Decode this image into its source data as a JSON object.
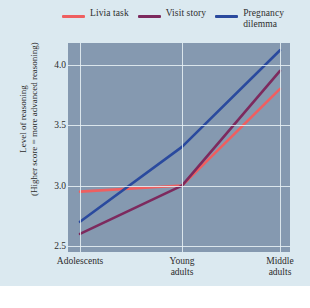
{
  "chart_data": {
    "type": "line",
    "title": "",
    "xlabel": "",
    "ylabel": "Level of reasoning\n(Higher score = more advanced reasoning)",
    "categories": [
      "Adolescents",
      "Young\nadults",
      "Middle\nadults"
    ],
    "ylim": [
      2.45,
      4.18
    ],
    "yticks": [
      2.5,
      3.0,
      3.5,
      4.0
    ],
    "ytick_labels": [
      "2.5",
      "3.0",
      "3.5",
      "4.0"
    ],
    "grid": true,
    "legend_position": "top",
    "series": [
      {
        "name": "Livia task",
        "values": [
          2.95,
          3.0,
          3.8
        ],
        "color": "#ef5f60"
      },
      {
        "name": "Visit story",
        "values": [
          2.6,
          3.0,
          3.95
        ],
        "color": "#7d2a5e"
      },
      {
        "name": "Pregnancy\ndilemma",
        "values": [
          2.7,
          3.32,
          4.12
        ],
        "color": "#2a4a9e"
      }
    ]
  },
  "legend": {
    "items": [
      {
        "label": "Livia task",
        "color": "#ef5f60"
      },
      {
        "label": "Visit story",
        "color": "#7d2a5e"
      },
      {
        "label": "Pregnancy\ndilemma",
        "color": "#2a4a9e"
      }
    ]
  },
  "colors": {
    "page_background": "#dbe9f0",
    "plot_background": "#8599b0",
    "gridline": "#e9f2f6",
    "text": "#2c2c2c"
  }
}
